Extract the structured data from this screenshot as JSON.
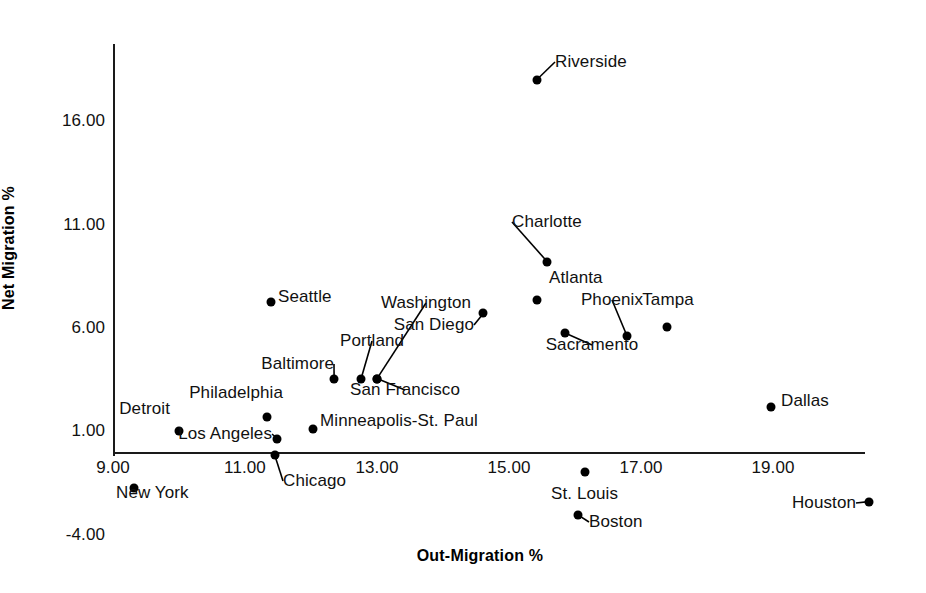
{
  "chart_data": {
    "type": "scatter",
    "title": "",
    "xlabel": "Out-Migration %",
    "ylabel": "Net Migration %",
    "xlim": [
      9.0,
      20.4
    ],
    "ylim": [
      -4.0,
      18.5
    ],
    "xticks": [
      "9.00",
      "11.00",
      "13.00",
      "15.00",
      "17.00",
      "19.00"
    ],
    "xtick_values": [
      9.0,
      11.0,
      13.0,
      15.0,
      17.0,
      19.0
    ],
    "yticks": [
      "-4.00",
      "1.00",
      "6.00",
      "11.00",
      "16.00"
    ],
    "ytick_values": [
      -4.0,
      1.0,
      6.0,
      11.0,
      16.0
    ],
    "grid": false,
    "legend": "none",
    "points": [
      {
        "label": "Riverside",
        "x": 15.42,
        "y": 18.0,
        "lx": 555,
        "ly": 62,
        "anchor": "start",
        "leader": true
      },
      {
        "label": "Charlotte",
        "x": 15.58,
        "y": 9.2,
        "lx": 512,
        "ly": 222,
        "anchor": "start",
        "leader": true
      },
      {
        "label": "Atlanta",
        "x": 15.42,
        "y": 7.35,
        "lx": 549,
        "ly": 278,
        "anchor": "start",
        "leader": false
      },
      {
        "label": "Tampa",
        "x": 17.39,
        "y": 6.05,
        "lx": 668,
        "ly": 300,
        "anchor": "mid",
        "leader": false
      },
      {
        "label": "Phoenix",
        "x": 16.79,
        "y": 5.6,
        "lx": 612,
        "ly": 300,
        "anchor": "mid",
        "leader": true
      },
      {
        "label": "Sacramento",
        "x": 15.85,
        "y": 5.75,
        "lx": 592,
        "ly": 345,
        "anchor": "mid",
        "leader": true
      },
      {
        "label": "San Diego",
        "x": 14.61,
        "y": 6.7,
        "lx": 474,
        "ly": 325,
        "anchor": "end",
        "leader": true
      },
      {
        "label": "Washington",
        "x": 13.0,
        "y": 3.55,
        "lx": 426,
        "ly": 303,
        "anchor": "mid",
        "leader": true
      },
      {
        "label": "Seattle",
        "x": 11.39,
        "y": 7.25,
        "lx": 278,
        "ly": 297,
        "anchor": "start",
        "leader": false
      },
      {
        "label": "Portland",
        "x": 12.76,
        "y": 3.55,
        "lx": 372,
        "ly": 341,
        "anchor": "mid",
        "leader": true
      },
      {
        "label": "Baltimore",
        "x": 12.35,
        "y": 3.55,
        "lx": 334,
        "ly": 364,
        "anchor": "end",
        "leader": true
      },
      {
        "label": "San Francisco",
        "x": 13.0,
        "y": 3.55,
        "lx": 405,
        "ly": 390,
        "anchor": "mid",
        "leader": true
      },
      {
        "label": "Philadelphia",
        "x": 11.33,
        "y": 1.7,
        "lx": 283,
        "ly": 393,
        "anchor": "end",
        "leader": false
      },
      {
        "label": "Detroit",
        "x": 10.0,
        "y": 1.0,
        "lx": 170,
        "ly": 409,
        "anchor": "end",
        "leader": false
      },
      {
        "label": "Los Angeles",
        "x": 11.49,
        "y": 0.65,
        "lx": 272,
        "ly": 434,
        "anchor": "end",
        "leader": true
      },
      {
        "label": "Minneapolis-St. Paul",
        "x": 12.03,
        "y": 1.1,
        "lx": 320,
        "ly": 421,
        "anchor": "start",
        "leader": false
      },
      {
        "label": "Dallas",
        "x": 18.97,
        "y": 2.2,
        "lx": 781,
        "ly": 401,
        "anchor": "start",
        "leader": false
      },
      {
        "label": "Chicago",
        "x": 11.45,
        "y": -0.15,
        "lx": 283,
        "ly": 481,
        "anchor": "start",
        "leader": true
      },
      {
        "label": "New York",
        "x": 9.32,
        "y": -1.75,
        "lx": 116,
        "ly": 493,
        "anchor": "start",
        "leader": false
      },
      {
        "label": "St. Louis",
        "x": 16.15,
        "y": -0.95,
        "lx": 551,
        "ly": 494,
        "anchor": "start",
        "leader": false
      },
      {
        "label": "Boston",
        "x": 16.05,
        "y": -3.05,
        "lx": 589,
        "ly": 522,
        "anchor": "start",
        "leader": true
      },
      {
        "label": "Houston",
        "x": 20.45,
        "y": -2.4,
        "lx": 856,
        "ly": 503,
        "anchor": "end",
        "leader": true
      }
    ]
  },
  "colors": {
    "point": "#000000",
    "axis": "#1a1a1a",
    "text": "#111111",
    "background": "#ffffff"
  }
}
